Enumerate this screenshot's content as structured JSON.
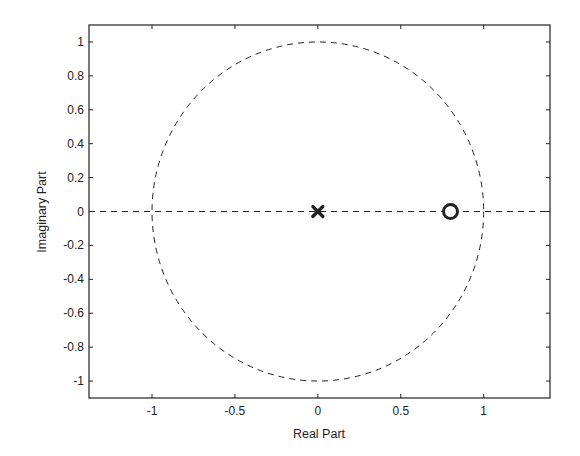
{
  "chart_data": {
    "type": "scatter",
    "title": "",
    "subtitle": "Pole-zero plot",
    "xlabel": "Real Part",
    "ylabel": "Imaginary Part",
    "xlim": [
      -1.38,
      1.4
    ],
    "ylim": [
      -1.1,
      1.1
    ],
    "grid": false,
    "legend": null,
    "x_ticks": [
      -1,
      -0.5,
      0,
      0.5,
      1
    ],
    "x_tick_labels": [
      "-1",
      "-0.5",
      "0",
      "0.5",
      "1"
    ],
    "y_ticks": [
      1,
      0.8,
      0.6,
      0.4,
      0.2,
      0,
      -0.2,
      -0.4,
      -0.6,
      -0.8,
      -1
    ],
    "y_tick_labels": [
      "1",
      "0.8",
      "0.6",
      "0.4",
      "0.2",
      "0",
      "-0.2",
      "-0.4",
      "-0.6",
      "-0.8",
      "-1"
    ],
    "series": [
      {
        "name": "poles",
        "marker": "x",
        "points": [
          {
            "x": 0,
            "y": 0
          }
        ]
      },
      {
        "name": "zeros",
        "marker": "o",
        "points": [
          {
            "x": 0.8,
            "y": 0
          }
        ]
      }
    ],
    "annotations": [
      {
        "type": "unit-circle",
        "center": [
          0,
          0
        ],
        "radius": 1,
        "style": "dashed"
      },
      {
        "type": "real-axis-line",
        "y": 0,
        "style": "dashed"
      }
    ]
  },
  "colors": {
    "line": "#222222",
    "background": "#ffffff"
  }
}
